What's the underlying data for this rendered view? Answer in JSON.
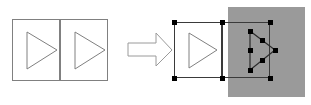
{
  "figure": {
    "canvas": {
      "width": 311,
      "height": 105,
      "background": "#ffffff"
    },
    "colors": {
      "outline": "#808080",
      "outline_dark": "#4d4d4d",
      "selection_stroke": "#333333",
      "handle_fill": "#000000",
      "overlay_fill": "#9a9a9a",
      "shape_fill": "#ffffff",
      "arrow_stroke": "#9a9a9a",
      "page_background": "#ffffff"
    },
    "panels": [
      {
        "id": "before",
        "name": "before-state",
        "label": "",
        "selected": false,
        "group": {
          "x": 12,
          "y": 19,
          "width": 96,
          "height": 62,
          "divider_x": 60
        },
        "cells": [
          {
            "name": "left-cell",
            "rect": {
              "x": 12,
              "y": 19,
              "width": 48,
              "height": 62
            },
            "triangle": {
              "points": "27,32 27,69 57,50",
              "direction": "right"
            }
          },
          {
            "name": "right-cell",
            "rect": {
              "x": 60,
              "y": 19,
              "width": 48,
              "height": 62
            },
            "triangle": {
              "points": "75,32 75,69 105,50",
              "direction": "right"
            }
          }
        ]
      },
      {
        "id": "after",
        "name": "after-state",
        "label": "",
        "selected": true,
        "group": {
          "x": 174,
          "y": 22,
          "width": 96,
          "height": 56,
          "divider_x": 222
        },
        "cells": [
          {
            "name": "left-cell",
            "rect": {
              "x": 174,
              "y": 22,
              "width": 48,
              "height": 56
            },
            "triangle": {
              "points": "189,33 189,68 217,50",
              "direction": "right"
            },
            "selected": false
          },
          {
            "name": "right-cell",
            "rect": {
              "x": 222,
              "y": 22,
              "width": 48,
              "height": 56
            },
            "triangle": {
              "points": "250,31 250,70 275,50",
              "direction": "right"
            },
            "selected": true
          }
        ],
        "overlay": {
          "name": "gray-overlay",
          "x": 228,
          "y": 7,
          "width": 77,
          "height": 90,
          "fill": "#9a9a9a",
          "opacity": 1
        },
        "selection_box": {
          "x": 174,
          "y": 22,
          "width": 96,
          "height": 56
        },
        "handles": {
          "size": 5,
          "group_handles": [
            {
              "name": "handle-top-left",
              "x": 174,
              "y": 22
            },
            {
              "name": "handle-top-middle",
              "x": 222,
              "y": 22
            },
            {
              "name": "handle-top-right",
              "x": 270,
              "y": 22
            },
            {
              "name": "handle-bottom-left",
              "x": 174,
              "y": 78
            },
            {
              "name": "handle-bottom-middle",
              "x": 222,
              "y": 78
            },
            {
              "name": "handle-bottom-right",
              "x": 270,
              "y": 78
            }
          ],
          "shape_handles": [
            {
              "name": "handle-vertex-top-left",
              "x": 250,
              "y": 31
            },
            {
              "name": "handle-vertex-bottom-left",
              "x": 250,
              "y": 70
            },
            {
              "name": "handle-vertex-right",
              "x": 275,
              "y": 50
            },
            {
              "name": "handle-midpoint-left-edge",
              "x": 250,
              "y": 50
            },
            {
              "name": "handle-midpoint-upper-edge",
              "x": 262,
              "y": 40
            },
            {
              "name": "handle-midpoint-lower-edge",
              "x": 262,
              "y": 60
            }
          ]
        }
      }
    ],
    "arrow": {
      "name": "transformation-arrow",
      "label": "",
      "direction": "right",
      "points": "128,43 156,43 156,33 172,50 156,66 156,56 128,56",
      "stroke": "#9a9a9a",
      "fill": "#ffffff"
    }
  }
}
